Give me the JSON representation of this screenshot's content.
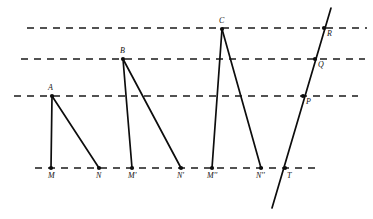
{
  "figure": {
    "width": 373,
    "height": 219,
    "background_color": "#ffffff",
    "line_color": "#0d0d0d",
    "dashed_line_color": "#1a1a1a"
  },
  "chart_data": {
    "type": "diagram",
    "xlabel": "",
    "ylabel": "",
    "grid": false,
    "legend": false,
    "parallel_lines": [
      {
        "name": "line-top",
        "y": 28,
        "x_start": 27,
        "x_end": 367,
        "dashed": true
      },
      {
        "name": "line-second",
        "y": 59,
        "x_start": 21,
        "x_end": 365,
        "dashed": true
      },
      {
        "name": "line-third",
        "y": 96,
        "x_start": 14,
        "x_end": 358,
        "dashed": true
      },
      {
        "name": "line-base",
        "y": 168,
        "x_start": 35,
        "x_end": 318,
        "dashed": true
      }
    ],
    "points": [
      {
        "id": "A",
        "label": "A",
        "x": 52,
        "y": 96,
        "label_dx": -4,
        "label_dy": -12,
        "on_line": "line-third"
      },
      {
        "id": "M",
        "label": "M",
        "x": 51,
        "y": 168,
        "label_dx": -3,
        "label_dy": 4,
        "on_line": "line-base"
      },
      {
        "id": "N",
        "label": "N",
        "x": 99,
        "y": 168,
        "label_dx": -3,
        "label_dy": 4,
        "on_line": "line-base"
      },
      {
        "id": "B",
        "label": "B",
        "x": 123,
        "y": 59,
        "label_dx": -3,
        "label_dy": -12,
        "on_line": "line-second"
      },
      {
        "id": "M1",
        "label": "M'",
        "x": 132,
        "y": 168,
        "label_dx": -4,
        "label_dy": 4,
        "on_line": "line-base"
      },
      {
        "id": "N1",
        "label": "N'",
        "x": 181,
        "y": 168,
        "label_dx": -4,
        "label_dy": 4,
        "on_line": "line-base"
      },
      {
        "id": "C",
        "label": "C",
        "x": 222,
        "y": 29,
        "label_dx": -3,
        "label_dy": -12,
        "on_line": "line-top"
      },
      {
        "id": "M2",
        "label": "M''",
        "x": 212,
        "y": 168,
        "label_dx": -5,
        "label_dy": 4,
        "on_line": "line-base"
      },
      {
        "id": "N2",
        "label": "N''",
        "x": 261,
        "y": 168,
        "label_dx": -5,
        "label_dy": 4,
        "on_line": "line-base"
      },
      {
        "id": "T",
        "label": "T",
        "x": 285,
        "y": 168,
        "label_dx": 2,
        "label_dy": 4,
        "on_line": "line-base"
      },
      {
        "id": "P",
        "label": "P",
        "x": 303,
        "y": 96,
        "label_dx": 3,
        "label_dy": 2,
        "on_line": "line-third"
      },
      {
        "id": "Q",
        "label": "Q",
        "x": 315,
        "y": 59,
        "label_dx": 3,
        "label_dy": 2,
        "on_line": "line-second"
      },
      {
        "id": "R",
        "label": "R",
        "x": 324,
        "y": 28,
        "label_dx": 3,
        "label_dy": 2,
        "on_line": "line-top"
      }
    ],
    "segments": [
      {
        "name": "segment-A-M",
        "from": "A",
        "to": "M",
        "x1": 52,
        "y1": 96,
        "x2": 51,
        "y2": 168
      },
      {
        "name": "segment-A-N",
        "from": "A",
        "to": "N",
        "x1": 52,
        "y1": 96,
        "x2": 99,
        "y2": 168
      },
      {
        "name": "segment-B-M1",
        "from": "B",
        "to": "M'",
        "x1": 123,
        "y1": 59,
        "x2": 132,
        "y2": 168
      },
      {
        "name": "segment-B-N1",
        "from": "B",
        "to": "N'",
        "x1": 123,
        "y1": 59,
        "x2": 181,
        "y2": 168
      },
      {
        "name": "segment-C-M2",
        "from": "C",
        "to": "M''",
        "x1": 222,
        "y1": 29,
        "x2": 212,
        "y2": 168
      },
      {
        "name": "segment-C-N2",
        "from": "C",
        "to": "N''",
        "x1": 222,
        "y1": 29,
        "x2": 261,
        "y2": 168
      }
    ],
    "transversal": {
      "name": "transversal-T-R",
      "x1": 272,
      "y1": 208,
      "x2": 331,
      "y2": 8,
      "passes_through": [
        "T",
        "P",
        "Q",
        "R"
      ]
    },
    "triangles": [
      {
        "name": "triangle-AMN",
        "vertices": [
          "A",
          "M",
          "N"
        ]
      },
      {
        "name": "triangle-BM1N1",
        "vertices": [
          "B",
          "M'",
          "N'"
        ]
      },
      {
        "name": "triangle-CM2N2",
        "vertices": [
          "C",
          "M''",
          "N''"
        ]
      }
    ]
  }
}
